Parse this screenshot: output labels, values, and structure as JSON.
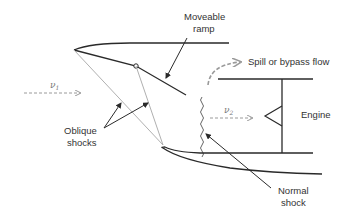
{
  "diagram": {
    "labels": {
      "moveable_ramp_line1": "Moveable",
      "moveable_ramp_line2": "ramp",
      "spill_flow": "Spill or bypass flow",
      "v1": "ν",
      "v1_sub": "1",
      "v2": "ν",
      "v2_sub": "2",
      "engine": "Engine",
      "oblique_line1": "Oblique",
      "oblique_line2": "shocks",
      "normal_line1": "Normal",
      "normal_line2": "shock"
    },
    "colors": {
      "line": "#2a2a2a",
      "shock": "#b0b0b0",
      "flow_arrow": "#9a9a9a",
      "text": "#333333"
    },
    "nodes": [
      "Moveable ramp",
      "Spill or bypass flow",
      "Engine",
      "Oblique shocks",
      "Normal shock"
    ],
    "edges": [
      {
        "from": "Free stream v1",
        "to": "Inlet"
      },
      {
        "from": "Inlet",
        "to": "Engine",
        "label": "v2"
      },
      {
        "from": "Inlet",
        "to": "Spill or bypass flow"
      }
    ]
  }
}
